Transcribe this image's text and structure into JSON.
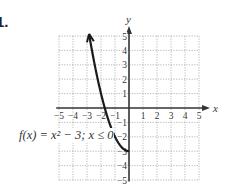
{
  "problem": {
    "number": "1."
  },
  "chart_data": {
    "type": "line",
    "title": "",
    "xlabel": "x",
    "ylabel": "y",
    "xlim": [
      -5,
      5
    ],
    "ylim": [
      -5,
      5
    ],
    "grid": true,
    "x_ticks": [
      "−5",
      "−4",
      "−3",
      "−2",
      "−1",
      "1",
      "2",
      "3",
      "4",
      "5"
    ],
    "y_ticks": [
      "5",
      "4",
      "3",
      "2",
      "1",
      "−1",
      "−2",
      "−3",
      "−4",
      "−5"
    ],
    "series": [
      {
        "name": "f(x) = x² − 3; x ≤ 0",
        "function": "x^2 - 3",
        "domain": "x <= 0",
        "x": [
          0,
          -0.5,
          -1,
          -1.5,
          -1.732,
          -2,
          -2.5,
          -2.83
        ],
        "values": [
          -3,
          -2.75,
          -2,
          -0.75,
          0,
          1,
          3.25,
          5
        ],
        "endpoint_arrow": "at (-2.83, 5)"
      }
    ],
    "annotations": [
      {
        "text": "f(x) = x² − 3; x ≤ 0",
        "position": "left of curve near y = −2"
      }
    ]
  },
  "labels": {
    "axis_x": "x",
    "axis_y": "y",
    "func_text": "f(x) = x² − 3; x ≤ 0"
  },
  "colors": {
    "grid": "#9a9a9a",
    "axis": "#333333",
    "curve": "#1a1a1a",
    "text": "#333333"
  }
}
